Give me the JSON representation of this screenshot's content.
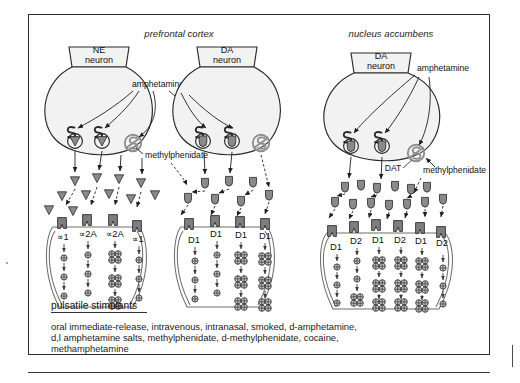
{
  "figure": {
    "panels": [
      {
        "id": "prefrontal-cortex",
        "title": "prefrontal cortex"
      },
      {
        "id": "nucleus-accumbens",
        "title": "nucleus accumbens"
      }
    ],
    "neurons": [
      {
        "id": "ne-neuron-pfc",
        "line1": "NE",
        "line2": "neuron",
        "region": "prefrontal cortex"
      },
      {
        "id": "da-neuron-pfc",
        "line1": "DA",
        "line2": "neuron",
        "region": "prefrontal cortex"
      },
      {
        "id": "da-neuron-nac",
        "line1": "DA",
        "line2": "neuron",
        "region": "nucleus accumbens"
      }
    ],
    "drug_labels": [
      {
        "id": "amphetamine-pfc",
        "text": "amphetamine"
      },
      {
        "id": "methylphenidate-pfc",
        "text": "methylphenidate"
      },
      {
        "id": "amphetamine-nac",
        "text": "amphetamine"
      },
      {
        "id": "methylphenidate-nac",
        "text": "methylphenidate"
      }
    ],
    "transporter_labels": [
      {
        "id": "dat",
        "text": "DAT"
      }
    ],
    "receptors": {
      "ne_neuron_pfc": [
        "∝1",
        "∝2A",
        "∝2A",
        "∝1"
      ],
      "da_neuron_pfc": [
        "D1",
        "D1",
        "D1",
        "D1"
      ],
      "da_neuron_nac": [
        "D1",
        "D2",
        "D1",
        "D2",
        "D1",
        "D2"
      ]
    },
    "legend": {
      "heading": "pulsatile stimulants",
      "caption_lines": [
        "oral immediate-release, intravenous, intranasal, smoked, d-amphetamine,",
        "d,l amphetamine salts, methylphenidate, d-methylphenidate, cocaine,",
        "methamphetamine"
      ]
    },
    "colors": {
      "frame_border": "#2b2b2b",
      "soma_fill": "#f2f2f2",
      "particle_fill": "#8a8a8a",
      "receptor_fill": "#7e7e7e",
      "blocker_ring": "#8e8e8e",
      "text": "#1a1a1a",
      "background": "#ffffff"
    }
  }
}
